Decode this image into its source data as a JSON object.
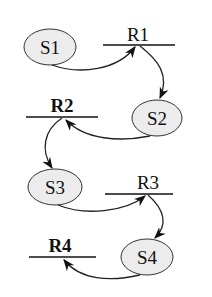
{
  "diagram": {
    "states": [
      {
        "id": "S1",
        "label": "S1"
      },
      {
        "id": "S2",
        "label": "S2"
      },
      {
        "id": "S3",
        "label": "S3"
      },
      {
        "id": "S4",
        "label": "S4"
      }
    ],
    "resources": [
      {
        "id": "R1",
        "label": "R1",
        "bold": false
      },
      {
        "id": "R2",
        "label": "R2",
        "bold": true
      },
      {
        "id": "R3",
        "label": "R3",
        "bold": false
      },
      {
        "id": "R4",
        "label": "R4",
        "bold": true
      }
    ],
    "edges": [
      {
        "from": "S1",
        "to": "R1"
      },
      {
        "from": "R1",
        "to": "S2"
      },
      {
        "from": "S2",
        "to": "R2"
      },
      {
        "from": "R2",
        "to": "S3"
      },
      {
        "from": "S3",
        "to": "R3"
      },
      {
        "from": "R3",
        "to": "S4"
      },
      {
        "from": "S4",
        "to": "R4"
      }
    ],
    "colors": {
      "node_fill": "#ececec",
      "stroke": "#222222",
      "background": "#ffffff"
    }
  }
}
